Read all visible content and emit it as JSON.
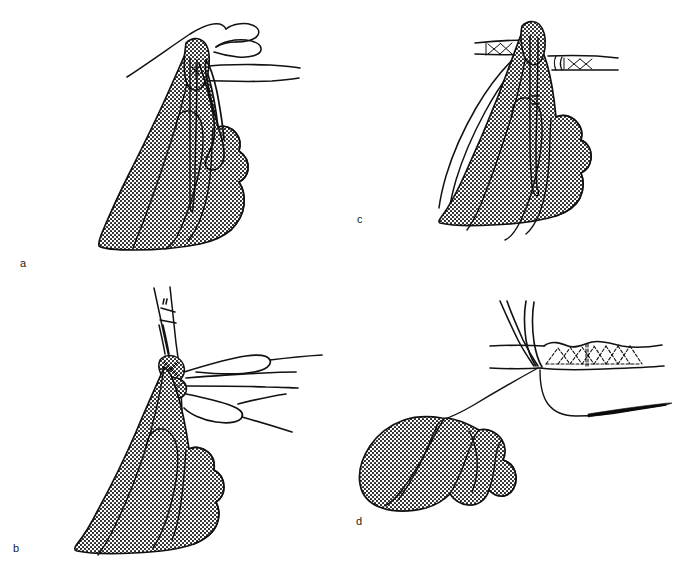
{
  "figure": {
    "kind": "medical-surgical-line-illustration",
    "background_color": "#ffffff",
    "ink_color": "#111111",
    "stipple_color": "#1a1a1a",
    "cropped_header_text": "",
    "panels": [
      {
        "id": "a",
        "label": "a",
        "caption_text": "a",
        "description": "Gloved hand holding vessel end with bare hand and tube above; suture loop hangs down",
        "elements": [
          "gloved-hand",
          "bare-hand-outline",
          "tube-graft",
          "suture-loop",
          "forceps-tip"
        ]
      },
      {
        "id": "b",
        "label": "b",
        "caption_text": "b",
        "description": "Gloved hand with hemostat clamp grasping knot; long suture strands with loops extend right",
        "elements": [
          "gloved-hand",
          "hemostat-clamp",
          "suture-strands",
          "suture-loops",
          "knot"
        ]
      },
      {
        "id": "c",
        "label": "c",
        "caption_text": "c",
        "description": "Gloved hand with forceps holding anastomosis; two tube ends with cross-stitch sutures, free suture tails to the left",
        "elements": [
          "gloved-hand",
          "forceps",
          "tube-graft-left",
          "tube-graft-right",
          "cross-stitch-sutures",
          "suture-tails"
        ]
      },
      {
        "id": "d",
        "label": "d",
        "caption_text": "d",
        "description": "Gloved hand pulling suture thread taut; completed cross-stitched tube anastomosis with curved needle",
        "elements": [
          "gloved-hand",
          "tube-graft",
          "cross-stitch-sutures",
          "suture-thread",
          "surgical-needle",
          "forceps-tips"
        ]
      }
    ]
  }
}
